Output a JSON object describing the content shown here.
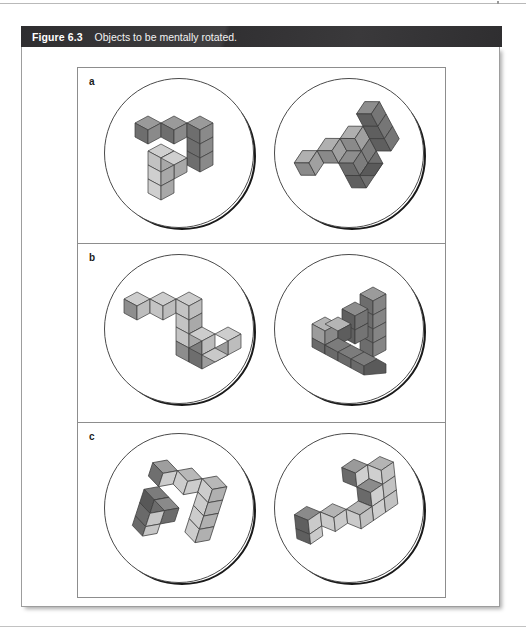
{
  "figure": {
    "number_label": "Figure 6.3",
    "caption": "Objects to be mentally rotated.",
    "bar_color": "#333234",
    "frame_border_color": "#9d9d9d",
    "panel_border_color": "#8d8d8d"
  },
  "panels": [
    {
      "label": "a",
      "left": {
        "name": "object-a-original",
        "description": "F-shaped block figure, upright view",
        "cube_count": 10
      },
      "right": {
        "name": "object-a-rotated",
        "description": "Same F-shaped block figure rotated about 120 degrees",
        "cube_count": 10
      }
    },
    {
      "label": "b",
      "left": {
        "name": "object-b-original",
        "description": "Zigzag S-shaped block figure, upright view",
        "cube_count": 10
      },
      "right": {
        "name": "object-b-rotated",
        "description": "Same zigzag block figure rotated and tilted, forming an A-like silhouette",
        "cube_count": 10
      }
    },
    {
      "label": "c",
      "left": {
        "name": "object-c-original",
        "description": "Hooked Z-shaped block figure, tilted view",
        "cube_count": 10
      },
      "right": {
        "name": "object-c-rotated",
        "description": "Same hooked Z-shaped block figure rotated in the picture plane",
        "cube_count": 10
      }
    }
  ],
  "colors": {
    "cube_top": "#b9b9b9",
    "cube_front": "#d4d4d4",
    "cube_side": "#8f8f8f",
    "cube_dark": "#6e6e6e",
    "cube_edge": "#3b3b3b",
    "circle_stroke": "#4a4a4a",
    "circle_shadow": "#1a1a1a",
    "page_rule": "#b9b9b9"
  }
}
